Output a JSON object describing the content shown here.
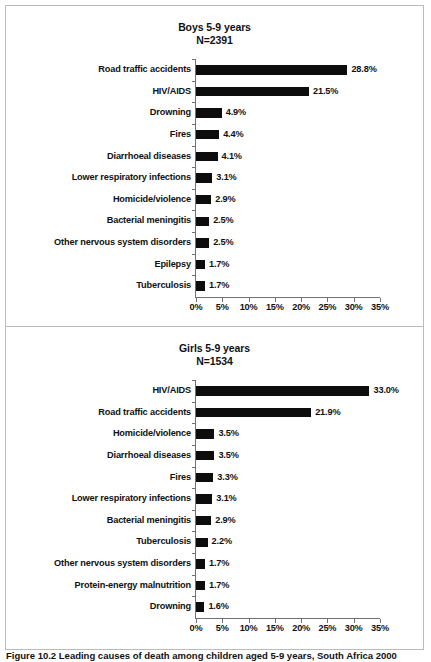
{
  "figure": {
    "caption": "Figure 10.2  Leading causes of death among children aged 5-9 years, South Africa 2000"
  },
  "chart_data": [
    {
      "type": "bar",
      "orientation": "horizontal",
      "title": "Boys 5-9 years",
      "subtitle": "N=2391",
      "n": 2391,
      "xlabel": "",
      "ylabel": "",
      "xlim": [
        0,
        35
      ],
      "grid": false,
      "legend": "none",
      "tick_labels": [
        "0%",
        "5%",
        "10%",
        "15%",
        "20%",
        "25%",
        "30%",
        "35%"
      ],
      "tick_values": [
        0,
        5,
        10,
        15,
        20,
        25,
        30,
        35
      ],
      "categories": [
        "Road traffic accidents",
        "HIV/AIDS",
        "Drowning",
        "Fires",
        "Diarrhoeal diseases",
        "Lower respiratory infections",
        "Homicide/violence",
        "Bacterial meningitis",
        "Other nervous system disorders",
        "Epilepsy",
        "Tuberculosis"
      ],
      "values": [
        28.8,
        21.5,
        4.9,
        4.4,
        4.1,
        3.1,
        2.9,
        2.5,
        2.5,
        1.7,
        1.7
      ],
      "value_labels": [
        "28.8%",
        "21.5%",
        "4.9%",
        "4.4%",
        "4.1%",
        "3.1%",
        "2.9%",
        "2.5%",
        "2.5%",
        "1.7%",
        "1.7%"
      ]
    },
    {
      "type": "bar",
      "orientation": "horizontal",
      "title": "Girls 5-9 years",
      "subtitle": "N=1534",
      "n": 1534,
      "xlabel": "",
      "ylabel": "",
      "xlim": [
        0,
        35
      ],
      "grid": false,
      "legend": "none",
      "tick_labels": [
        "0%",
        "5%",
        "10%",
        "15%",
        "20%",
        "25%",
        "30%",
        "35%"
      ],
      "tick_values": [
        0,
        5,
        10,
        15,
        20,
        25,
        30,
        35
      ],
      "categories": [
        "HIV/AIDS",
        "Road traffic accidents",
        "Homicide/violence",
        "Diarrhoeal diseases",
        "Fires",
        "Lower respiratory infections",
        "Bacterial meningitis",
        "Tuberculosis",
        "Other nervous system disorders",
        "Protein-energy malnutrition",
        "Drowning"
      ],
      "values": [
        33.0,
        21.9,
        3.5,
        3.5,
        3.3,
        3.1,
        2.9,
        2.2,
        1.7,
        1.7,
        1.6
      ],
      "value_labels": [
        "33.0%",
        "21.9%",
        "3.5%",
        "3.5%",
        "3.3%",
        "3.1%",
        "2.9%",
        "2.2%",
        "1.7%",
        "1.7%",
        "1.6%"
      ]
    }
  ],
  "colors": {
    "bar": "#0d0d0d",
    "axis": "#6e7276",
    "frame": "#b9bcbe",
    "text": "#111111",
    "background": "#ffffff"
  }
}
